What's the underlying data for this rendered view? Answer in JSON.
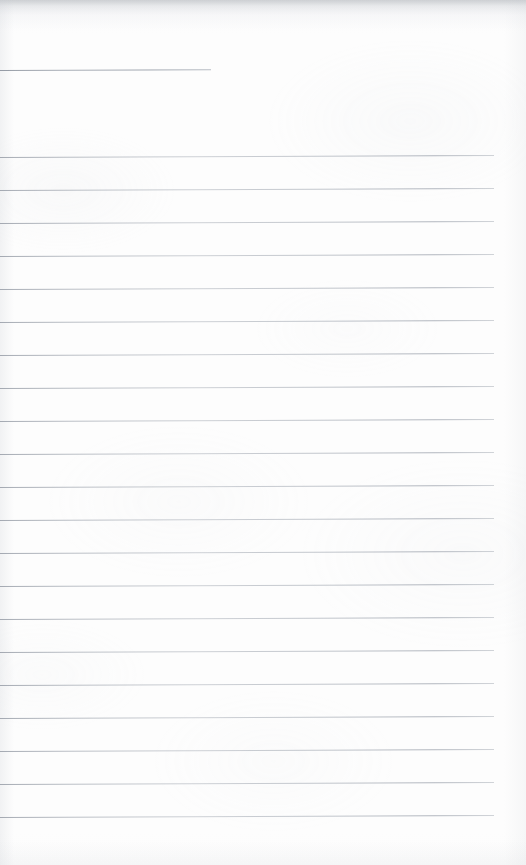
{
  "document": {
    "kind": "scanned-lined-notebook-page",
    "title": "Blank Lined Notebook Page",
    "page_width": 526,
    "page_height": 865,
    "paper_color": "#fdfdfd",
    "rule_color": "#a8aeb8",
    "rule_thickness_px": 1,
    "written_content": "",
    "has_text": false,
    "note": "Blank ruled page — no handwriting, no printed text, no headers or page numbers visible."
  },
  "layout": {
    "rule_left_x": 0,
    "rule_right_x": 494,
    "rule_spacing_px": 33,
    "first_full_rule_y": 157,
    "last_full_rule_y": 817,
    "full_rule_count": 21,
    "skew_deg": -0.23,
    "bottom_margin_px": 48,
    "right_margin_px": 32
  },
  "rules": [
    {
      "name": "opening-short-rule",
      "y": 70,
      "x": 0,
      "width": 211,
      "short": true
    },
    {
      "name": "rule-01",
      "y": 157,
      "x": 0,
      "width": 494,
      "short": false
    },
    {
      "name": "rule-02",
      "y": 190,
      "x": 0,
      "width": 494,
      "short": false
    },
    {
      "name": "rule-03",
      "y": 223,
      "x": 0,
      "width": 494,
      "short": false
    },
    {
      "name": "rule-04",
      "y": 256,
      "x": 0,
      "width": 494,
      "short": false
    },
    {
      "name": "rule-05",
      "y": 289,
      "x": 0,
      "width": 494,
      "short": false
    },
    {
      "name": "rule-06",
      "y": 322,
      "x": 0,
      "width": 494,
      "short": false
    },
    {
      "name": "rule-07",
      "y": 355,
      "x": 0,
      "width": 494,
      "short": false
    },
    {
      "name": "rule-08",
      "y": 388,
      "x": 0,
      "width": 494,
      "short": false
    },
    {
      "name": "rule-09",
      "y": 421,
      "x": 0,
      "width": 494,
      "short": false
    },
    {
      "name": "rule-10",
      "y": 454,
      "x": 0,
      "width": 494,
      "short": false
    },
    {
      "name": "rule-11",
      "y": 487,
      "x": 0,
      "width": 494,
      "short": false
    },
    {
      "name": "rule-12",
      "y": 520,
      "x": 0,
      "width": 494,
      "short": false
    },
    {
      "name": "rule-13",
      "y": 553,
      "x": 0,
      "width": 494,
      "short": false
    },
    {
      "name": "rule-14",
      "y": 586,
      "x": 0,
      "width": 494,
      "short": false
    },
    {
      "name": "rule-15",
      "y": 619,
      "x": 0,
      "width": 494,
      "short": false
    },
    {
      "name": "rule-16",
      "y": 652,
      "x": 0,
      "width": 494,
      "short": false
    },
    {
      "name": "rule-17",
      "y": 685,
      "x": 0,
      "width": 494,
      "short": false
    },
    {
      "name": "rule-18",
      "y": 718,
      "x": 0,
      "width": 494,
      "short": false
    },
    {
      "name": "rule-19",
      "y": 751,
      "x": 0,
      "width": 494,
      "short": false
    },
    {
      "name": "rule-20",
      "y": 784,
      "x": 0,
      "width": 494,
      "short": false
    },
    {
      "name": "rule-21",
      "y": 817,
      "x": 0,
      "width": 494,
      "short": false
    }
  ]
}
